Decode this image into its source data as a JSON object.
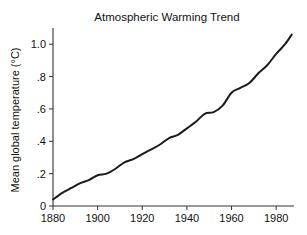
{
  "chart_data": {
    "type": "line",
    "title": "Atmospheric Warming Trend",
    "xlabel": "",
    "ylabel": "Mean global temperature (°C)",
    "xlim": [
      1880,
      1988
    ],
    "ylim": [
      0,
      1.1
    ],
    "grid": false,
    "legend": false,
    "xticks": [
      1880,
      1900,
      1920,
      1940,
      1960,
      1980
    ],
    "xtick_labels": [
      "1880",
      "1900",
      "1920",
      "1940",
      "1960",
      "1980"
    ],
    "yticks": [
      0,
      0.2,
      0.4,
      0.6,
      0.8,
      1.0
    ],
    "ytick_labels": [
      "0",
      ".2",
      ".4",
      ".6",
      ".8",
      "1.0"
    ],
    "line_color": "#1b1b1b",
    "series": [
      {
        "name": "Mean global temperature",
        "x": [
          1880,
          1884,
          1888,
          1892,
          1896,
          1900,
          1904,
          1908,
          1912,
          1916,
          1920,
          1924,
          1928,
          1932,
          1936,
          1940,
          1944,
          1948,
          1952,
          1956,
          1960,
          1964,
          1968,
          1972,
          1976,
          1980,
          1984,
          1987
        ],
        "values": [
          0.04,
          0.08,
          0.11,
          0.14,
          0.16,
          0.19,
          0.2,
          0.23,
          0.27,
          0.29,
          0.32,
          0.35,
          0.38,
          0.42,
          0.44,
          0.48,
          0.52,
          0.57,
          0.58,
          0.62,
          0.7,
          0.73,
          0.76,
          0.82,
          0.87,
          0.94,
          1.0,
          1.06
        ]
      }
    ]
  },
  "figure": {
    "background_color": "#ffffff",
    "axis_color": "#333333"
  }
}
